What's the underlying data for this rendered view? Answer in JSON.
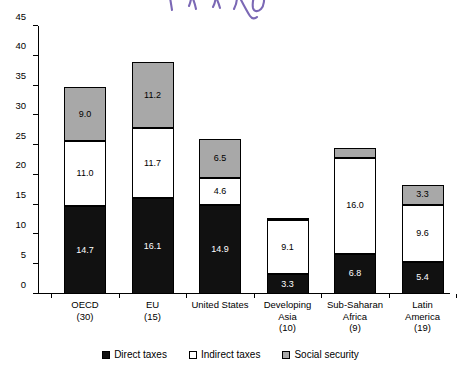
{
  "annotation": {
    "type": "handwritten-scribble",
    "color": "#7B68B5"
  },
  "legend": {
    "position": "bottom-center",
    "items": [
      {
        "label": "Direct taxes",
        "color": "#111111",
        "key": "direct"
      },
      {
        "label": "Indirect taxes",
        "color": "#ffffff",
        "key": "indirect"
      },
      {
        "label": "Social security",
        "color": "#a8a8a8",
        "key": "social"
      }
    ]
  },
  "chart_data": {
    "type": "bar",
    "stacked": true,
    "title": "",
    "subtitle": "",
    "xlabel": "",
    "ylabel": "",
    "ylim": [
      0,
      45
    ],
    "ytick_step": 5,
    "grid": false,
    "legend_position": "bottom",
    "categories": [
      "OECD\n(30)",
      "EU\n(15)",
      "United States",
      "Developing\nAsia\n(10)",
      "Sub-Saharan\nAfrica\n(9)",
      "Latin\nAmerica\n(19)"
    ],
    "category_lines": [
      [
        "OECD",
        "(30)"
      ],
      [
        "EU",
        "(15)"
      ],
      [
        "United States"
      ],
      [
        "Developing",
        "Asia",
        "(10)"
      ],
      [
        "Sub-Saharan",
        "Africa",
        "(9)"
      ],
      [
        "Latin",
        "America",
        "(19)"
      ]
    ],
    "ticks": [
      0,
      5,
      10,
      15,
      20,
      25,
      30,
      35,
      40,
      45
    ],
    "tick_labels": [
      "0",
      "5",
      "10",
      "15",
      "20",
      "25",
      "30",
      "35",
      "40",
      "45"
    ],
    "series": [
      {
        "name": "Direct taxes",
        "color": "#111111",
        "values": [
          14.7,
          16.1,
          14.9,
          3.3,
          6.8,
          5.4
        ],
        "labels": [
          "14.7",
          "16.1",
          "14.9",
          "3.3",
          "6.8",
          "5.4"
        ]
      },
      {
        "name": "Indirect taxes",
        "color": "#ffffff",
        "values": [
          11.0,
          11.7,
          4.6,
          9.1,
          16.0,
          9.6
        ],
        "labels": [
          "11.0",
          "11.7",
          "4.6",
          "9.1",
          "16.0",
          "9.6"
        ]
      },
      {
        "name": "Social security",
        "color": "#a8a8a8",
        "values": [
          9.0,
          11.2,
          6.5,
          0.1,
          1.7,
          3.3
        ],
        "labels": [
          "9.0",
          "11.2",
          "6.5",
          "0.1",
          "1.7",
          "3.3"
        ]
      }
    ],
    "totals": [
      34.7,
      39.0,
      26.0,
      12.5,
      24.5,
      18.3
    ]
  }
}
